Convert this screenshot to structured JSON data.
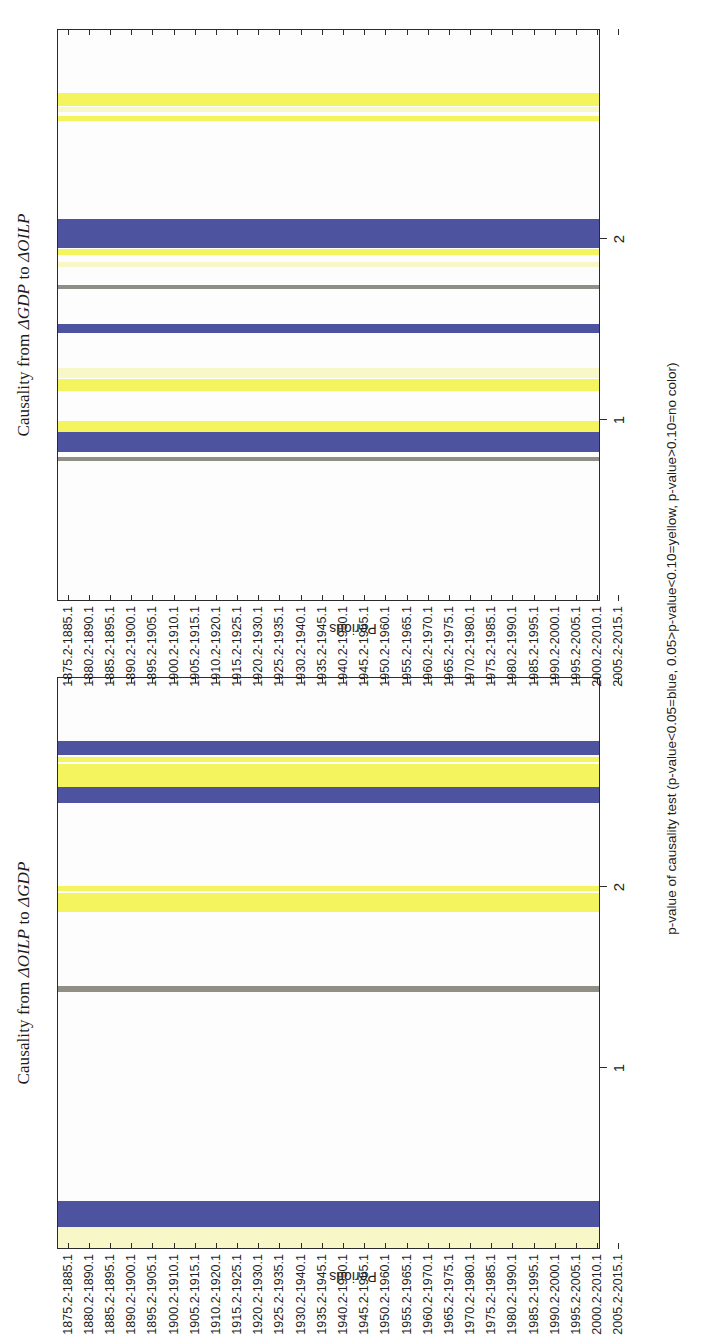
{
  "figure": {
    "caption": "p-value of causality test (p-value<0.05=blue, 0.05>p-value<0.10=yellow, p-value>0.10=no color)",
    "colors": {
      "blue": "#4e53a0",
      "yellow": "#f4f45e",
      "pale_yellow": "#f7f7c8",
      "none": "#ffffff",
      "axis": "#2b2b2b",
      "text": "#1d1d1d"
    },
    "axis_title_y": "Periods",
    "x_ticks": [
      1,
      2
    ],
    "x_tick_labels": [
      "1",
      "2"
    ],
    "xlim": [
      0,
      3
    ],
    "period_labels": [
      "1875.2-1885.1",
      "1880.2-1890.1",
      "1885.2-1895.1",
      "1890.2-1900.1",
      "1895.2-1905.1",
      "1900.2-1910.1",
      "1905.2-1915.1",
      "1910.2-1920.1",
      "1915.2-1925.1",
      "1920.2-1930.1",
      "1925.2-1935.1",
      "1930.2-1940.1",
      "1935.2-1945.1",
      "1940.2-1950.1",
      "1945.2-1955.1",
      "1950.2-1960.1",
      "1955.2-1965.1",
      "1960.2-1970.1",
      "1965.2-1975.1",
      "1970.2-1980.1",
      "1975.2-1985.1",
      "1980.2-1990.1",
      "1985.2-1995.1",
      "1990.2-2000.1",
      "1995.2-2005.1",
      "2000.2-2010.1",
      "2005.2-2015.1"
    ]
  },
  "chart_data": [
    {
      "type": "heatmap",
      "title": "Causality from ΔOILP to ΔGDP",
      "title_plain": "Causality from DOILP to DGDP",
      "xlabel": "p-value of causality test (p-value<0.05=blue, 0.05>p-value<0.10=yellow, p-value>0.10=no color)",
      "ylabel": "Periods",
      "xlim": [
        0,
        3
      ],
      "x_tick_labels": [
        "1",
        "2"
      ],
      "grid": false,
      "legend": "none",
      "categories": [
        "1875.2-1885.1",
        "1880.2-1890.1",
        "1885.2-1895.1",
        "1890.2-1900.1",
        "1895.2-1905.1",
        "1900.2-1910.1",
        "1905.2-1915.1",
        "1910.2-1920.1",
        "1915.2-1925.1",
        "1920.2-1930.1",
        "1925.2-1935.1",
        "1930.2-1940.1",
        "1935.2-1945.1",
        "1940.2-1950.1",
        "1945.2-1955.1",
        "1950.2-1960.1",
        "1955.2-1965.1",
        "1960.2-1970.1",
        "1965.2-1975.1",
        "1970.2-1980.1",
        "1975.2-1985.1",
        "1980.2-1990.1",
        "1985.2-1995.1",
        "1990.2-2000.1",
        "1995.2-2005.1",
        "2000.2-2010.1",
        "2005.2-2015.1"
      ],
      "significance": [
        "yellow",
        "blue",
        "none",
        "none",
        "none",
        "none",
        "none",
        "none",
        "none",
        "none",
        "none",
        "none",
        "none",
        "none",
        "none",
        "yellow",
        "yellow",
        "none",
        "none",
        "none",
        "none",
        "blue",
        "yellow",
        "blue",
        "none",
        "none",
        "none"
      ],
      "bands": [
        {
          "label": "1875.2-1885.1",
          "start": 0.0,
          "end": 1.0,
          "color": "pale_yellow",
          "significance": "yellow"
        },
        {
          "label": "1880.2-1890.1",
          "start": 1.0,
          "end": 2.2,
          "color": "blue",
          "significance": "blue"
        },
        {
          "label": "1935.2-1945.1",
          "start": 12.1,
          "end": 12.35,
          "color": "none",
          "significance": "none"
        },
        {
          "label": "1955.2-1965.1",
          "start": 15.85,
          "end": 16.75,
          "color": "yellow",
          "significance": "yellow"
        },
        {
          "label": "1957-1967",
          "start": 16.85,
          "end": 17.1,
          "color": "yellow",
          "significance": "yellow"
        },
        {
          "label": "1980.2-1990.1",
          "start": 21.0,
          "end": 21.75,
          "color": "blue",
          "significance": "blue"
        },
        {
          "label": "1982-1992",
          "start": 21.75,
          "end": 22.85,
          "color": "yellow",
          "significance": "yellow"
        },
        {
          "label": "1985.2-1995.1",
          "start": 22.95,
          "end": 23.2,
          "color": "yellow",
          "significance": "yellow"
        },
        {
          "label": "1986-1996",
          "start": 23.25,
          "end": 23.95,
          "color": "blue",
          "significance": "blue"
        }
      ]
    },
    {
      "type": "heatmap",
      "title": "Causality from ΔGDP to ΔOILP",
      "title_plain": "Causality from DGDP to DOILP",
      "xlabel": "p-value of causality test (p-value<0.05=blue, 0.05>p-value<0.10=yellow, p-value>0.10=no color)",
      "ylabel": "Periods",
      "xlim": [
        0,
        3
      ],
      "x_tick_labels": [
        "1",
        "2"
      ],
      "grid": false,
      "legend": "none",
      "categories": [
        "1875.2-1885.1",
        "1880.2-1890.1",
        "1885.2-1895.1",
        "1890.2-1900.1",
        "1895.2-1905.1",
        "1900.2-1910.1",
        "1905.2-1915.1",
        "1910.2-1920.1",
        "1915.2-1925.1",
        "1920.2-1930.1",
        "1925.2-1935.1",
        "1930.2-1940.1",
        "1935.2-1945.1",
        "1940.2-1950.1",
        "1945.2-1955.1",
        "1950.2-1960.1",
        "1955.2-1965.1",
        "1960.2-1970.1",
        "1965.2-1975.1",
        "1970.2-1980.1",
        "1975.2-1985.1",
        "1980.2-1990.1",
        "1985.2-1995.1",
        "1990.2-2000.1",
        "1995.2-2005.1",
        "2000.2-2010.1",
        "2005.2-2015.1"
      ],
      "significance": [
        "none",
        "none",
        "none",
        "none",
        "none",
        "none",
        "none",
        "blue",
        "yellow",
        "none",
        "yellow",
        "none",
        "blue",
        "none",
        "none",
        "yellow",
        "blue",
        "blue",
        "none",
        "none",
        "none",
        "none",
        "yellow",
        "yellow",
        "none",
        "none",
        "none"
      ],
      "bands": [
        {
          "label": "1906-1916",
          "start": 6.55,
          "end": 6.75,
          "color": "none",
          "significance": "none"
        },
        {
          "label": "1910.2-1920.1",
          "start": 7.0,
          "end": 7.95,
          "color": "blue",
          "significance": "blue"
        },
        {
          "label": "1913-1923",
          "start": 7.95,
          "end": 8.45,
          "color": "yellow",
          "significance": "yellow"
        },
        {
          "label": "1920.2-1930.1",
          "start": 9.85,
          "end": 10.45,
          "color": "yellow",
          "significance": "yellow"
        },
        {
          "label": "1923-1933",
          "start": 10.5,
          "end": 10.95,
          "color": "pale_yellow",
          "significance": "yellow"
        },
        {
          "label": "1935.2-1945.1",
          "start": 12.6,
          "end": 13.05,
          "color": "blue",
          "significance": "blue"
        },
        {
          "label": "1945.2-1955.1",
          "start": 14.7,
          "end": 14.85,
          "color": "none",
          "significance": "none"
        },
        {
          "label": "1950.2-1960.1",
          "start": 15.7,
          "end": 15.95,
          "color": "pale_yellow",
          "significance": "yellow"
        },
        {
          "label": "1953-1963",
          "start": 16.3,
          "end": 16.55,
          "color": "yellow",
          "significance": "yellow"
        },
        {
          "label": "1955.2-1965.1",
          "start": 16.6,
          "end": 18.0,
          "color": "blue",
          "significance": "blue"
        },
        {
          "label": "1985.2-1995.1",
          "start": 22.6,
          "end": 22.85,
          "color": "yellow",
          "significance": "yellow"
        },
        {
          "label": "1987-1997",
          "start": 23.05,
          "end": 23.25,
          "color": "pale_yellow",
          "significance": "yellow"
        },
        {
          "label": "1988-1998",
          "start": 23.3,
          "end": 23.95,
          "color": "yellow",
          "significance": "yellow"
        }
      ]
    }
  ]
}
